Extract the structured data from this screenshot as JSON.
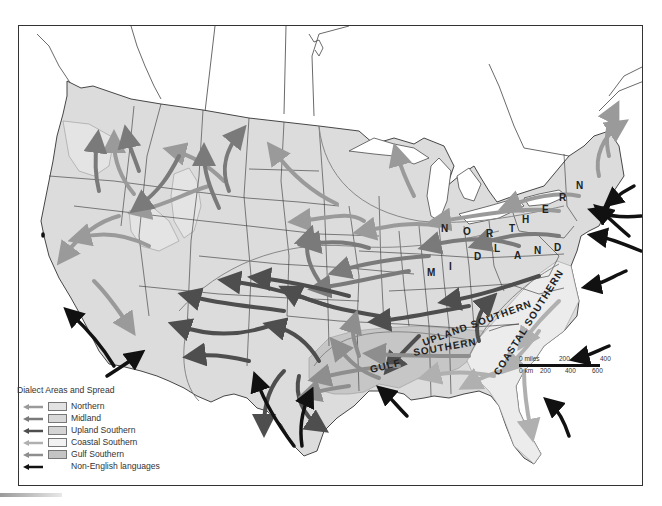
{
  "map": {
    "title": "Dialect Areas and Spread",
    "region_labels": {
      "northern": [
        "N",
        "O",
        "R",
        "T",
        "H",
        "E",
        "R",
        "N"
      ],
      "midland": [
        "M",
        "I",
        "D",
        "L",
        "A",
        "N",
        "D"
      ],
      "upland_southern": "UPLAND SOUTHERN",
      "coastal_southern": "COASTAL SOUTHERN",
      "gulf": "GULF",
      "southern": "SOUTHERN"
    },
    "colors": {
      "land": "#dcdcdc",
      "northern_fill": "#dedede",
      "midland_fill": "#d6d6d6",
      "upland_southern_fill": "#d2d2d2",
      "coastal_southern_fill": "#eeeeee",
      "gulf_southern_fill": "#c4c4c4",
      "northern_arrow": "#9a9a9a",
      "midland_arrow": "#7a7a7a",
      "upland_southern_arrow": "#4e4e4e",
      "coastal_southern_arrow": "#b0b0b0",
      "gulf_southern_arrow": "#8e8e8e",
      "non_english_arrow": "#111111",
      "border": "#333333"
    }
  },
  "legend": {
    "title": "Dialect Areas and Spread",
    "items": [
      {
        "label": "Northern",
        "arrow_color": "#9a9a9a",
        "swatch_color": "#e2e2e2"
      },
      {
        "label": "Midland",
        "arrow_color": "#7a7a7a",
        "swatch_color": "#d8d8d8"
      },
      {
        "label": "Upland Southern",
        "arrow_color": "#4e4e4e",
        "swatch_color": "#d4d4d4"
      },
      {
        "label": "Coastal Southern",
        "arrow_color": "#b0b0b0",
        "swatch_color": "#f2f2f2"
      },
      {
        "label": "Gulf Southern",
        "arrow_color": "#8e8e8e",
        "swatch_color": "#c4c4c4"
      },
      {
        "label": "Non-English languages",
        "arrow_color": "#111111",
        "swatch_color": null
      }
    ]
  },
  "scale": {
    "miles_label": "0 miles",
    "miles_ticks": [
      "200",
      "400"
    ],
    "km_label": "0 km",
    "km_ticks": [
      "200",
      "400",
      "600"
    ]
  }
}
